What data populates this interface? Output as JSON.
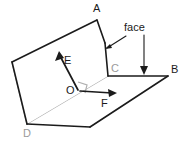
{
  "diagram": {
    "background_color": "#ffffff",
    "dark_color": "#1b1b1b",
    "gray_color": "#b0b0b0",
    "gray_label_color": "#9a9a9a",
    "labels": {
      "a": "A",
      "b": "B",
      "c": "C",
      "d": "D",
      "e": "E",
      "f": "F",
      "o": "O",
      "face": "face"
    },
    "points": {
      "A": [
        97,
        20
      ],
      "B": [
        168,
        76
      ],
      "C": [
        108,
        76
      ],
      "D": [
        27,
        124
      ],
      "O": [
        78,
        90
      ],
      "left_vertex": [
        12,
        62
      ],
      "fold_mid": [
        105,
        43
      ],
      "base_bottom_right": [
        90,
        127
      ]
    },
    "vectors": [
      {
        "name": "E",
        "from": [
          78,
          90
        ],
        "to": [
          58,
          52
        ],
        "label": "E",
        "label_pos": [
          65,
          61
        ]
      },
      {
        "name": "F",
        "from": [
          78,
          90
        ],
        "to": [
          117,
          94
        ],
        "label": "F",
        "label_pos": [
          104,
          106
        ]
      }
    ],
    "annotations": [
      {
        "name": "face-leader",
        "label": "face",
        "label_pos": [
          128,
          31
        ],
        "from": [
          126,
          35
        ],
        "to": [
          106,
          48
        ]
      },
      {
        "name": "face-drop-arrow",
        "from": [
          144,
          35
        ],
        "to": [
          144,
          74
        ]
      }
    ],
    "right_angle_marker": {
      "at": [
        78,
        90
      ],
      "size": 9
    }
  }
}
